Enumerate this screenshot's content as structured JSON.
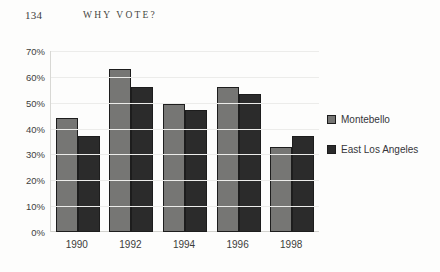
{
  "page": {
    "folio": "134",
    "running_title": "WHY VOTE?"
  },
  "legend": {
    "position": "right",
    "entries": [
      {
        "label": "Montebello",
        "color": "#767674",
        "swatch": "legend-swatch-light"
      },
      {
        "label": "East Los Angeles",
        "color": "#2b2b2b",
        "swatch": "legend-swatch-dark"
      }
    ]
  },
  "axis": {
    "y_ticks": [
      "0%",
      "10%",
      "20%",
      "30%",
      "40%",
      "50%",
      "60%",
      "70%"
    ],
    "x_ticks": [
      "1990",
      "1992",
      "1994",
      "1996",
      "1998"
    ]
  },
  "chart_data": {
    "type": "bar",
    "title": "",
    "xlabel": "",
    "ylabel": "",
    "ylim": [
      0,
      70
    ],
    "ytick_step": 10,
    "grid": true,
    "legend_position": "right",
    "categories": [
      "1990",
      "1992",
      "1994",
      "1996",
      "1998"
    ],
    "series": [
      {
        "name": "Montebello",
        "color": "#767674",
        "values": [
          44,
          63,
          49.5,
          56,
          33
        ]
      },
      {
        "name": "East Los Angeles",
        "color": "#2b2b2b",
        "values": [
          37,
          56,
          47,
          53.5,
          37
        ]
      }
    ]
  }
}
